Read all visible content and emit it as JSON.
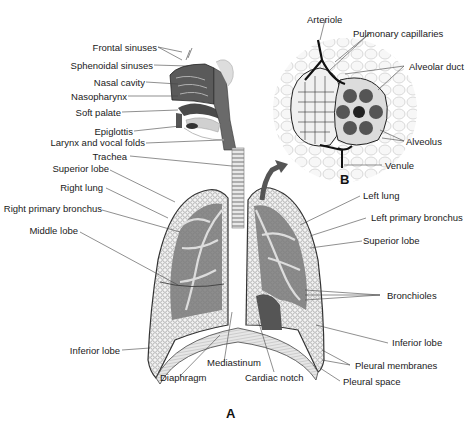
{
  "figure": {
    "panels": {
      "A": "A",
      "B": "B"
    },
    "panel_a_labels_left": [
      {
        "id": "frontal_sinuses",
        "text": "Frontal sinuses"
      },
      {
        "id": "sphenoidal_sinuses",
        "text": "Sphenoidal sinuses"
      },
      {
        "id": "nasal_cavity",
        "text": "Nasal cavity"
      },
      {
        "id": "nasopharynx",
        "text": "Nasopharynx"
      },
      {
        "id": "soft_palate",
        "text": "Soft palate"
      },
      {
        "id": "epiglottis",
        "text": "Epiglottis"
      },
      {
        "id": "larynx",
        "text": "Larynx and vocal folds"
      },
      {
        "id": "trachea",
        "text": "Trachea"
      },
      {
        "id": "superior_lobe_r",
        "text": "Superior lobe"
      },
      {
        "id": "right_lung",
        "text": "Right lung"
      },
      {
        "id": "right_primary_bronchus",
        "text": "Right primary bronchus"
      },
      {
        "id": "middle_lobe",
        "text": "Middle lobe"
      },
      {
        "id": "inferior_lobe_r",
        "text": "Inferior lobe"
      }
    ],
    "panel_a_labels_bottom": [
      {
        "id": "diaphragm",
        "text": "Diaphragm"
      },
      {
        "id": "mediastinum",
        "text": "Mediastinum"
      },
      {
        "id": "cardiac_notch",
        "text": "Cardiac notch"
      }
    ],
    "panel_a_labels_right": [
      {
        "id": "left_lung",
        "text": "Left lung"
      },
      {
        "id": "left_primary_bronchus",
        "text": "Left primary bronchus"
      },
      {
        "id": "superior_lobe_l",
        "text": "Superior lobe"
      },
      {
        "id": "bronchioles",
        "text": "Bronchioles"
      },
      {
        "id": "inferior_lobe_l",
        "text": "Inferior lobe"
      },
      {
        "id": "pleural_membranes",
        "text": "Pleural membranes"
      },
      {
        "id": "pleural_space",
        "text": "Pleural space"
      }
    ],
    "panel_b_labels": [
      {
        "id": "arteriole",
        "text": "Arteriole"
      },
      {
        "id": "pulmonary_capillaries",
        "text": "Pulmonary capillaries"
      },
      {
        "id": "alveolar_duct",
        "text": "Alveolar duct"
      },
      {
        "id": "alveolus",
        "text": "Alveolus"
      },
      {
        "id": "venule",
        "text": "Venule"
      }
    ],
    "colors": {
      "ink": "#1a1a1a",
      "dark_tissue": "#3a3a3a",
      "mid_tissue": "#8a8a8a",
      "light_tissue": "#d8d8d8"
    }
  }
}
